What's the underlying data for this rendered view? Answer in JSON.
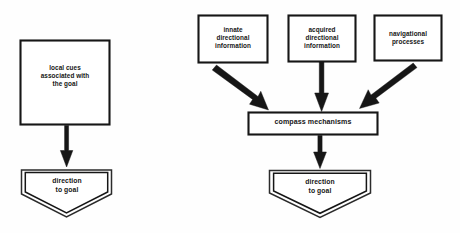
{
  "figure": {
    "background_color": "#fefefe",
    "ink_color": "#161616",
    "type": "flow-diagram",
    "panel_count": 2
  },
  "left_panel": {
    "name": "local-cue-navigation",
    "nodes": [
      {
        "id": "local-cues",
        "shape": "rectangle",
        "label": "local cues\nassociated with\nthe goal",
        "x": 20,
        "y": 40,
        "width": 90,
        "height": 85
      },
      {
        "id": "direction-to-goal-left",
        "shape": "pentagon-double-outline",
        "label": "direction\nto goal",
        "x": 21,
        "y": 167,
        "width": 92,
        "height": 51
      }
    ],
    "arrows": [
      {
        "id": "local-cues-to-direction",
        "from": "local-cues",
        "to": "direction-to-goal-left",
        "style": "thick-vertical-down"
      }
    ]
  },
  "right_panel": {
    "name": "compass-mechanism-navigation",
    "nodes": [
      {
        "id": "innate-directional-information",
        "shape": "rectangle",
        "label": "innate\ndirectional\ninformation",
        "x": 198,
        "y": 15,
        "width": 70,
        "height": 48
      },
      {
        "id": "acquired-directional-information",
        "shape": "rectangle",
        "label": "acquired\ndirectional\ninformation",
        "x": 288,
        "y": 15,
        "width": 68,
        "height": 47
      },
      {
        "id": "navigational-processes",
        "shape": "rectangle",
        "label": "navigational\nprocesses",
        "x": 374,
        "y": 15,
        "width": 68,
        "height": 46
      },
      {
        "id": "compass-mechanisms",
        "shape": "rectangle",
        "label": "compass mechanisms",
        "x": 248,
        "y": 112,
        "width": 130,
        "height": 23
      },
      {
        "id": "direction-to-goal-right",
        "shape": "pentagon-double-outline",
        "label": "direction\nto goal",
        "x": 269,
        "y": 168,
        "width": 102,
        "height": 50
      }
    ],
    "arrows": [
      {
        "id": "innate-to-compass",
        "from": "innate-directional-information",
        "to": "compass-mechanisms",
        "style": "thick-diagonal-down-right"
      },
      {
        "id": "acquired-to-compass",
        "from": "acquired-directional-information",
        "to": "compass-mechanisms",
        "style": "thick-vertical-down"
      },
      {
        "id": "navigational-to-compass",
        "from": "navigational-processes",
        "to": "compass-mechanisms",
        "style": "thick-diagonal-down-left"
      },
      {
        "id": "compass-to-direction",
        "from": "compass-mechanisms",
        "to": "direction-to-goal-right",
        "style": "thick-vertical-down"
      }
    ]
  }
}
